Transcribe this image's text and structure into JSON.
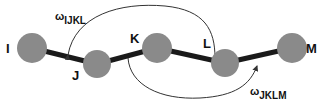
{
  "diagram": {
    "type": "dihedral-angle-chain",
    "atoms": [
      {
        "id": "I",
        "label": "I",
        "cx": 32,
        "cy": 48,
        "r": 15,
        "lx": 6,
        "ly": 53
      },
      {
        "id": "J",
        "label": "J",
        "cx": 97,
        "cy": 64,
        "r": 14,
        "lx": 72,
        "ly": 78
      },
      {
        "id": "K",
        "label": "K",
        "cx": 157,
        "cy": 48,
        "r": 15,
        "lx": 130,
        "ly": 43
      },
      {
        "id": "L",
        "label": "L",
        "cx": 225,
        "cy": 63,
        "r": 14,
        "lx": 203,
        "ly": 48
      },
      {
        "id": "M",
        "label": "M",
        "cx": 292,
        "cy": 48,
        "r": 15,
        "lx": 312,
        "ly": 53
      }
    ],
    "bonds": [
      [
        "I",
        "J"
      ],
      [
        "J",
        "K"
      ],
      [
        "K",
        "L"
      ],
      [
        "L",
        "M"
      ]
    ],
    "torsions": [
      {
        "symbol": "ω",
        "subscript": "IJKL",
        "x": 56,
        "y": 21
      },
      {
        "symbol": "ω",
        "subscript": "JKLM",
        "x": 251,
        "y": 100
      }
    ],
    "colors": {
      "atom_fill": "#8a8a8a",
      "bond": "#1a1a1a",
      "arc": "#333333",
      "label": "#111111"
    }
  }
}
